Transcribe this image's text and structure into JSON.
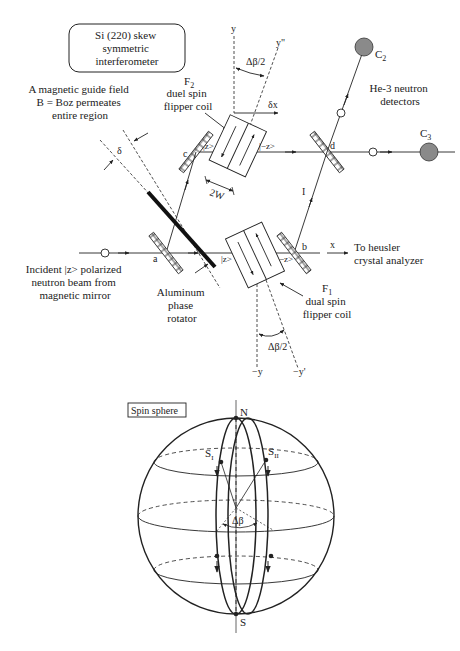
{
  "interferometer": {
    "title_lines": [
      "Si (220) skew",
      "symmetric",
      "interferometer"
    ],
    "guide_field_lines": [
      "A magnetic guide field",
      "B = Boz permeates",
      "entire region"
    ],
    "f2": {
      "name": "F",
      "sub": "2",
      "lines": [
        "duel spin",
        "flipper coil"
      ]
    },
    "f1": {
      "name": "F",
      "sub": "1",
      "lines": [
        "dual spin",
        "flipper coil"
      ]
    },
    "detectors_lines": [
      "He-3 neutron",
      "detectors"
    ],
    "c2": {
      "name": "C",
      "sub": "2"
    },
    "c3": {
      "name": "C",
      "sub": "3"
    },
    "incident_lines": [
      "Incident |z> polarized",
      "neutron beam from",
      "magnetic mirror"
    ],
    "rotator_lines": [
      "Aluminum",
      "phase",
      "rotator"
    ],
    "analyzer_lines": [
      "To heusler",
      "crystal analyzer"
    ],
    "labels": {
      "a": "a",
      "b": "b",
      "c": "c",
      "d": "d",
      "path_I": "I",
      "path_II": "II",
      "x": "x",
      "y": "y",
      "y_dprime": "y\"",
      "neg_y": "−y",
      "neg_y_prime": "−y'",
      "delta": "δ",
      "delta_x": "δx",
      "two_w": "2W",
      "delta_beta_half_top": "Δβ/2",
      "delta_beta_half_bottom": "Δβ/2",
      "ket_z_top": "|z>",
      "ket_negz_top": "|−z>",
      "ket_z_bottom": "|z>",
      "ket_negz_bottom": "−z>"
    }
  },
  "spin_sphere": {
    "title": "Spin sphere",
    "north": "N",
    "south": "S",
    "s1": {
      "name": "S",
      "sub": "I"
    },
    "s2": {
      "name": "S",
      "sub": "II"
    },
    "delta_beta": "Δβ"
  },
  "colors": {
    "ink": "#222222",
    "detector_fill": "#8a8a8a",
    "background": "#ffffff"
  }
}
